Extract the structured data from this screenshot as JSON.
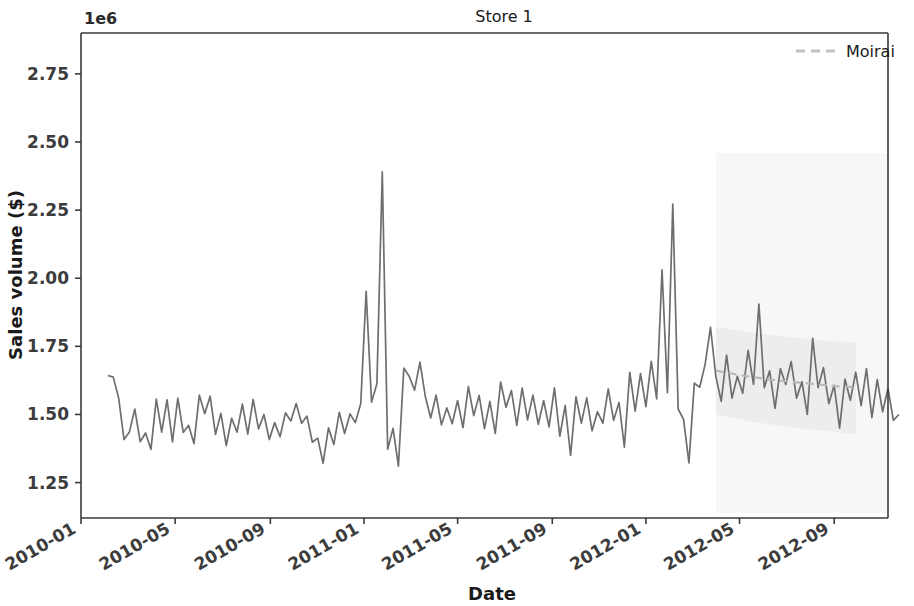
{
  "chart_data": {
    "type": "line",
    "title": "Store 1",
    "xlabel": "Date",
    "ylabel": "Sales volume ($)",
    "y_offset_text": "1e6",
    "y_offset_multiplier": 1000000,
    "ylim": [
      1120000,
      2900000
    ],
    "yticks": [
      1.25,
      1.5,
      1.75,
      2.0,
      2.25,
      2.5,
      2.75
    ],
    "ytick_labels": [
      "1.25",
      "1.50",
      "1.75",
      "2.00",
      "2.25",
      "2.50",
      "2.75"
    ],
    "xlim": [
      "2010-01-01",
      "2012-11-20"
    ],
    "xticks": [
      "2010-01",
      "2010-05",
      "2010-09",
      "2011-01",
      "2011-05",
      "2011-09",
      "2012-01",
      "2012-05",
      "2012-09"
    ],
    "xtick_labels": [
      "2010-01",
      "2010-05",
      "2010-09",
      "2011-01",
      "2011-05",
      "2011-09",
      "2012-01",
      "2012-05",
      "2012-09"
    ],
    "grid": false,
    "legend_position": "upper right",
    "legend": [
      {
        "name": "Moirai",
        "color": "#b9b9b9",
        "style": "dashed"
      }
    ],
    "series": [
      {
        "name": "Sales volume",
        "color": "#6e6e6e",
        "style": "solid",
        "x_start_index": 5,
        "x_step_days": 7,
        "values": [
          1643,
          1637,
          1560,
          1408,
          1436,
          1520,
          1400,
          1432,
          1372,
          1556,
          1435,
          1554,
          1399,
          1560,
          1434,
          1460,
          1393,
          1571,
          1503,
          1567,
          1427,
          1504,
          1386,
          1486,
          1435,
          1538,
          1428,
          1555,
          1447,
          1500,
          1408,
          1470,
          1418,
          1506,
          1476,
          1540,
          1468,
          1494,
          1398,
          1413,
          1321,
          1451,
          1390,
          1508,
          1430,
          1502,
          1470,
          1540,
          1952,
          1545,
          1613,
          2390,
          1372,
          1449,
          1310,
          1670,
          1640,
          1589,
          1692,
          1566,
          1487,
          1571,
          1462,
          1524,
          1466,
          1551,
          1452,
          1602,
          1496,
          1570,
          1448,
          1548,
          1430,
          1619,
          1526,
          1588,
          1460,
          1597,
          1480,
          1571,
          1464,
          1551,
          1454,
          1598,
          1420,
          1533,
          1350,
          1565,
          1468,
          1561,
          1440,
          1510,
          1468,
          1594,
          1478,
          1544,
          1380,
          1655,
          1512,
          1650,
          1529,
          1695,
          1557,
          2031,
          1580,
          2272,
          1520,
          1482,
          1322,
          1615,
          1600,
          1683,
          1820,
          1640,
          1548,
          1718,
          1560,
          1640,
          1578,
          1735,
          1610,
          1905,
          1598,
          1660,
          1522,
          1668,
          1610,
          1694,
          1560,
          1620,
          1500,
          1779,
          1598,
          1672,
          1540,
          1607,
          1450,
          1630,
          1552,
          1655,
          1532,
          1668,
          1488,
          1628,
          1510,
          1596,
          1478,
          1500
        ]
      },
      {
        "name": "Moirai",
        "color": "#b9b9b9",
        "style": "dashed",
        "forecast_start_index": 118,
        "values": [
          1661,
          1657,
          1654,
          1650,
          1646,
          1643,
          1640,
          1637,
          1634,
          1631,
          1628,
          1626,
          1624,
          1622,
          1620,
          1618,
          1616,
          1614,
          1612,
          1610,
          1608,
          1606,
          1604,
          1603,
          1602,
          1601,
          1600
        ],
        "band_lower": [
          1500,
          1496,
          1492,
          1488,
          1484,
          1480,
          1477,
          1473,
          1470,
          1467,
          1464,
          1461,
          1458,
          1456,
          1453,
          1450,
          1448,
          1446,
          1444,
          1442,
          1440,
          1438,
          1436,
          1434,
          1432,
          1430,
          1428
        ],
        "band_upper": [
          1822,
          1818,
          1815,
          1812,
          1808,
          1806,
          1803,
          1801,
          1798,
          1795,
          1792,
          1790,
          1788,
          1786,
          1784,
          1782,
          1780,
          1778,
          1776,
          1774,
          1772,
          1770,
          1769,
          1768,
          1767,
          1766,
          1765
        ]
      }
    ]
  },
  "figure": {
    "title": "Store 1",
    "xlabel": "Date",
    "ylabel": "Sales volume ($)",
    "offset_text": "1e6",
    "legend_entry": "Moirai"
  }
}
